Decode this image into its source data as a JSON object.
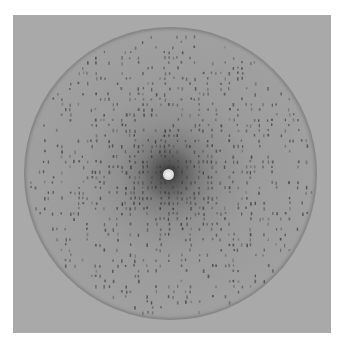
{
  "image": {
    "subject": "X-ray diffraction pattern",
    "description": "Circular detector image with lattice of dark diffraction spots arranged in horizontal rows, dense dark halo around central white beam-stop",
    "colors": {
      "background": "#ffffff",
      "plate": "#a9a9a9",
      "halo": "#2a2a2a",
      "spot": "#3a3a3a",
      "beamstop": "#eeeeee"
    },
    "detector": {
      "cx": 170,
      "cy": 173,
      "r": 146
    },
    "beamstop": {
      "cx": 168,
      "cy": 174,
      "r": 5.5
    },
    "lattice": {
      "row_spacing": 5.2,
      "col_spacing": 4.3,
      "seed": 7
    }
  }
}
